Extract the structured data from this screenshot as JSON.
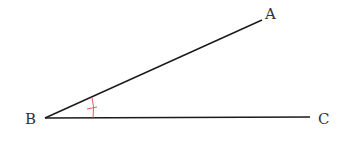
{
  "diagram": {
    "type": "angle",
    "labels": {
      "a": "A",
      "b": "B",
      "c": "C"
    },
    "points": {
      "A": [
        262,
        20
      ],
      "B": [
        45,
        118
      ],
      "C": [
        310,
        117
      ]
    },
    "colors": {
      "line": "#1a1a1a",
      "mark": "#e05a6a",
      "text": "#333333"
    },
    "angle_mark": {
      "vertex": "B",
      "style": "arc-with-tick"
    }
  }
}
